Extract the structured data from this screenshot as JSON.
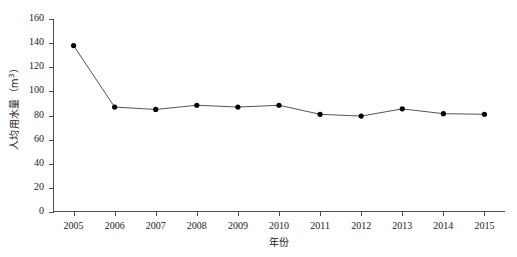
{
  "chart_data": {
    "type": "line",
    "title": "",
    "subtitle": "",
    "xlabel": "年份",
    "ylabel": "人均用水量（m³）",
    "ylabel_text": "人均用水量（m",
    "ylabel_sup": "3",
    "ylabel_tail": "）",
    "categories": [
      "2005",
      "2006",
      "2007",
      "2008",
      "2009",
      "2010",
      "2011",
      "2012",
      "2013",
      "2014",
      "2015"
    ],
    "x": [
      2005,
      2006,
      2007,
      2008,
      2009,
      2010,
      2011,
      2012,
      2013,
      2014,
      2015
    ],
    "values": [
      138,
      87,
      85,
      88.5,
      87,
      88.5,
      81,
      79.5,
      85.5,
      81.5,
      81
    ],
    "series": [
      {
        "name": "人均用水量",
        "values": [
          138,
          87,
          85,
          88.5,
          87,
          88.5,
          81,
          79.5,
          85.5,
          81.5,
          81
        ]
      }
    ],
    "ylim": [
      0,
      160
    ],
    "yticks": [
      0,
      20,
      40,
      60,
      80,
      100,
      120,
      140,
      160
    ],
    "ytick_labels": [
      "0",
      "20",
      "40",
      "60",
      "80",
      "100",
      "120",
      "140",
      "160"
    ],
    "xlim": [
      2004.5,
      2015.5
    ],
    "grid": false,
    "legend": null,
    "legend_position": "none",
    "line_color": "#555555",
    "marker_color": "#000000",
    "marker": "circle",
    "axis_color": "#4d4d4d",
    "background": "#ffffff"
  }
}
